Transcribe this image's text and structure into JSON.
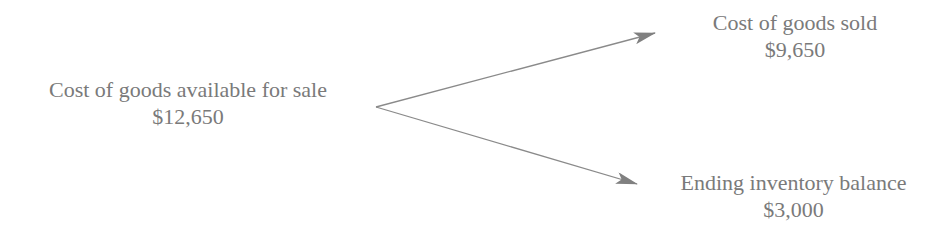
{
  "diagram": {
    "source": {
      "label": "Cost of goods available for sale",
      "value": "$12,650"
    },
    "targets": [
      {
        "label": "Cost of goods sold",
        "value": "$9,650"
      },
      {
        "label": "Ending inventory balance",
        "value": "$3,000"
      }
    ],
    "colors": {
      "text": "#7a7a7a",
      "arrow": "#808080",
      "background": "#ffffff"
    }
  }
}
